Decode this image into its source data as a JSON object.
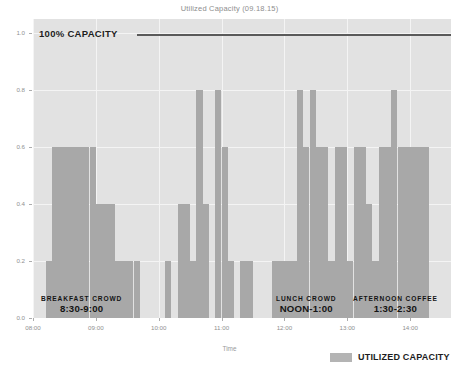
{
  "chart_data": {
    "type": "bar",
    "title": "Utilized Capacity (09.18.15)",
    "xlabel": "Time",
    "ylabel": "Percent of Capacity Utilized",
    "ylim": [
      0.0,
      1.05
    ],
    "xlim": [
      "08:00",
      "14:40"
    ],
    "grid": true,
    "legend_position": "bottom-right",
    "ytick_labels": [
      "0.0",
      "0.2",
      "0.4",
      "0.6",
      "0.8",
      "1.0"
    ],
    "ytick_values": [
      0.0,
      0.2,
      0.4,
      0.6,
      0.8,
      1.0
    ],
    "xtick_labels": [
      "08:00",
      "09:00",
      "10:00",
      "11:00",
      "12:00",
      "13:00",
      "14:00"
    ],
    "xtick_values": [
      8.0,
      9.0,
      10.0,
      11.0,
      12.0,
      13.0,
      14.0
    ],
    "legend": [
      {
        "name": "UTILIZED CAPACITY",
        "color": "#b4b4b4"
      }
    ],
    "series": [
      {
        "name": "UTILIZED CAPACITY",
        "color": "#a8a8a8",
        "x": [
          8.1,
          8.2,
          8.3,
          8.4,
          8.5,
          8.6,
          8.7,
          8.8,
          8.9,
          9.0,
          9.1,
          9.2,
          9.3,
          9.4,
          9.5,
          9.6,
          9.7,
          9.8,
          9.9,
          10.0,
          10.1,
          10.2,
          10.3,
          10.4,
          10.5,
          10.6,
          10.7,
          10.8,
          10.9,
          11.0,
          11.1,
          11.2,
          11.3,
          11.4,
          11.5,
          11.6,
          11.7,
          11.8,
          11.9,
          12.0,
          12.1,
          12.2,
          12.3,
          12.4,
          12.5,
          12.6,
          12.7,
          12.8,
          12.9,
          13.0,
          13.1,
          13.2,
          13.3,
          13.4,
          13.5,
          13.6,
          13.7,
          13.8,
          13.9,
          14.0,
          14.1,
          14.2,
          14.3
        ],
        "values": [
          0.0,
          0.2,
          0.6,
          0.6,
          0.6,
          0.6,
          0.6,
          0.6,
          0.6,
          0.4,
          0.4,
          0.4,
          0.2,
          0.2,
          0.2,
          0.2,
          0.0,
          0.0,
          0.0,
          0.0,
          0.2,
          0.0,
          0.4,
          0.4,
          0.2,
          0.8,
          0.4,
          0.0,
          0.8,
          0.6,
          0.2,
          0.0,
          0.2,
          0.2,
          0.0,
          0.0,
          0.0,
          0.2,
          0.2,
          0.2,
          0.2,
          0.8,
          0.6,
          0.8,
          0.6,
          0.6,
          0.2,
          0.6,
          0.6,
          0.2,
          0.6,
          0.6,
          0.4,
          0.2,
          0.6,
          0.6,
          0.8,
          0.6,
          0.6,
          0.6,
          0.6,
          0.6,
          0.0
        ]
      }
    ],
    "reference_line": {
      "label": "100% CAPACITY",
      "value": 1.0,
      "color": "#5a5a5a"
    },
    "annotations": [
      {
        "title": "BREAKFAST  CROWD",
        "range": "8:30-9:00"
      },
      {
        "title": "LUNCH  CROWD",
        "range": "NOON-1:00"
      },
      {
        "title": "AFTERNOON COFFEE",
        "range": "1:30-2:30"
      }
    ]
  }
}
